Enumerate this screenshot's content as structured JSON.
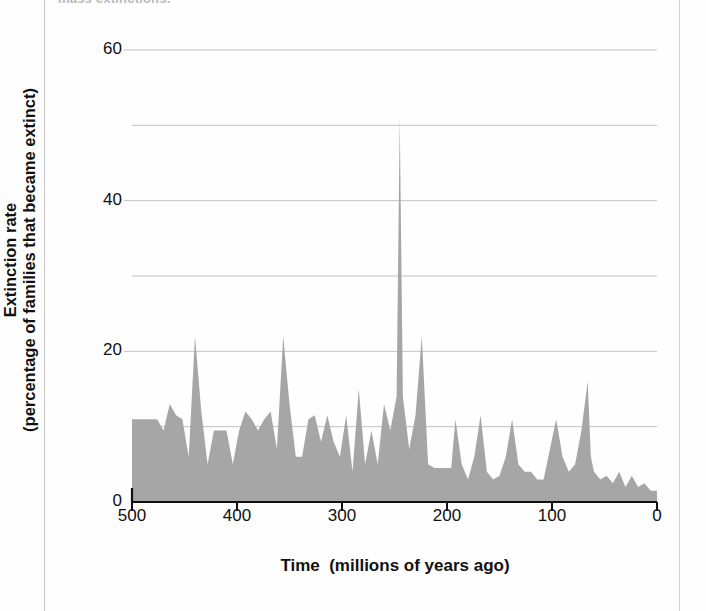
{
  "page": {
    "caption_top": "mass extinctions."
  },
  "chart_data": {
    "type": "area",
    "title": "",
    "xlabel": "Time  (millions of years ago)",
    "ylabel": "Extinction rate\n(percentage of families that became extinct)",
    "ylabel_line1": "Extinction rate",
    "ylabel_line2": "(percentage of families that became extinct)",
    "xlim": [
      500,
      0
    ],
    "ylim": [
      0,
      60
    ],
    "x_reversed": true,
    "grid": true,
    "gridlines_y": [
      10,
      20,
      30,
      40,
      50,
      60
    ],
    "legend": null,
    "fill_color": "#a6a6a6",
    "axis_color": "#111111",
    "grid_color": "#c2c2c2",
    "yticks": [
      0,
      20,
      40,
      60
    ],
    "ytick_labels": [
      "0",
      "20",
      "40",
      "60"
    ],
    "xticks": [
      500,
      400,
      300,
      200,
      100,
      0
    ],
    "xtick_labels": [
      "500",
      "400",
      "300",
      "200",
      "100",
      "0"
    ],
    "x": [
      500,
      494,
      488,
      482,
      476,
      470,
      464,
      458,
      452,
      446,
      440,
      434,
      428,
      422,
      416,
      410,
      404,
      398,
      392,
      386,
      380,
      374,
      368,
      362,
      356,
      350,
      344,
      338,
      332,
      326,
      320,
      314,
      308,
      302,
      296,
      290,
      284,
      278,
      272,
      266,
      260,
      254,
      248,
      245,
      242,
      236,
      230,
      224,
      218,
      212,
      206,
      200,
      196,
      192,
      186,
      180,
      174,
      168,
      162,
      156,
      150,
      144,
      138,
      132,
      126,
      120,
      114,
      108,
      102,
      96,
      90,
      84,
      78,
      72,
      66,
      63,
      60,
      54,
      48,
      42,
      36,
      30,
      24,
      18,
      12,
      6,
      0
    ],
    "y": [
      11,
      11,
      11,
      11,
      11,
      9.5,
      13,
      11.5,
      11,
      6,
      22,
      12,
      5,
      9.5,
      9.5,
      9.5,
      5,
      9.5,
      12,
      11,
      9.5,
      11,
      12,
      7,
      22,
      13,
      6,
      6,
      11,
      11.5,
      8,
      11.5,
      8,
      6,
      11.5,
      4,
      15,
      5,
      9.5,
      5,
      13,
      9.5,
      14,
      51,
      14,
      7,
      11.5,
      22,
      5,
      4.5,
      4.5,
      4.5,
      4.5,
      11,
      5,
      3,
      6,
      11.5,
      4,
      3,
      3.5,
      6,
      11,
      5,
      4,
      4,
      3,
      3,
      7,
      11,
      6,
      4,
      5,
      9.5,
      16,
      6,
      4,
      3,
      3.5,
      2.5,
      4,
      2,
      3.5,
      2,
      2.5,
      1.5,
      1.5
    ],
    "annotations": []
  }
}
